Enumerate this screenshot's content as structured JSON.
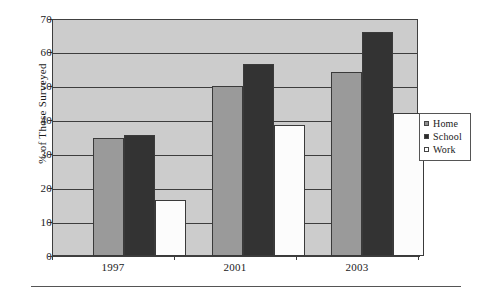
{
  "chart_data": {
    "type": "bar",
    "title": "",
    "subtitle": "",
    "xlabel": "",
    "ylabel": "% of Those Surveyed",
    "categories": [
      "1997",
      "2001",
      "2003"
    ],
    "series": [
      {
        "name": "Home",
        "color": "#9a9a9a",
        "values": [
          35,
          50.5,
          54.5
        ]
      },
      {
        "name": "School",
        "color": "#333333",
        "values": [
          36,
          57,
          66.5
        ]
      },
      {
        "name": "Work",
        "color": "#ffffff",
        "values": [
          16.5,
          39,
          42.5
        ]
      }
    ],
    "ylim": [
      0,
      70
    ],
    "yticks": [
      0,
      10,
      20,
      30,
      40,
      50,
      60,
      70
    ],
    "ytick_labels": [
      "0",
      "10",
      "20",
      "30",
      "40",
      "50",
      "60",
      "70"
    ],
    "grid": true,
    "grid_axis": "y",
    "legend_position": "right",
    "plot_background": "#cccccc"
  },
  "axes": {
    "y_title": "% of Those Surveyed",
    "y_ticks": [
      "70",
      "60",
      "50",
      "40",
      "30",
      "20",
      "10",
      "0"
    ],
    "x_ticks": [
      "1997",
      "2001",
      "2003"
    ]
  },
  "legend": {
    "items": [
      {
        "label": "Home",
        "swatch": "legend-swatch-home"
      },
      {
        "label": "School",
        "swatch": "legend-swatch-school"
      },
      {
        "label": "Work",
        "swatch": "legend-swatch-work"
      }
    ]
  }
}
